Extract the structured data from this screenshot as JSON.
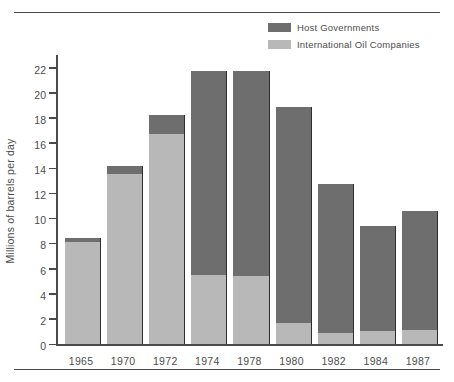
{
  "chart_data": {
    "type": "bar",
    "title": "",
    "subtitle": "",
    "xlabel": "",
    "ylabel": "Millions of barrels per day",
    "ylim": [
      0,
      23
    ],
    "yticks": [
      0,
      2,
      4,
      6,
      8,
      10,
      12,
      14,
      16,
      18,
      20,
      22
    ],
    "grid": false,
    "stacked": true,
    "legend_position": "top-right",
    "categories": [
      "1965",
      "1970",
      "1972",
      "1974",
      "1978",
      "1980",
      "1982",
      "1984",
      "1987"
    ],
    "series": [
      {
        "name": "International Oil Companies",
        "color": "#b8b8b8",
        "values": [
          8.1,
          13.5,
          16.7,
          5.5,
          5.4,
          1.7,
          0.9,
          1.0,
          1.1
        ]
      },
      {
        "name": "Host Governments",
        "color": "#6e6e6e",
        "values": [
          0.3,
          0.7,
          1.5,
          16.2,
          16.3,
          17.2,
          11.8,
          8.4,
          9.5
        ]
      }
    ],
    "totals": [
      8.4,
      14.2,
      18.2,
      21.7,
      21.7,
      18.9,
      12.7,
      9.4,
      10.6
    ]
  },
  "legend": {
    "items": [
      {
        "label": "Host Governments",
        "swatch": "#6e6e6e"
      },
      {
        "label": "International Oil Companies",
        "swatch": "#b8b8b8"
      }
    ]
  },
  "axes": {
    "y_label": "Millions of barrels per day",
    "y_ticks": [
      "22",
      "20",
      "18",
      "16",
      "14",
      "12",
      "10",
      "8",
      "6",
      "4",
      "2",
      "0"
    ],
    "x_ticks": [
      "1965",
      "1970",
      "1972",
      "1974",
      "1978",
      "1980",
      "1982",
      "1984",
      "1987"
    ]
  },
  "colors": {
    "host_governments": "#6e6e6e",
    "international_oil_companies": "#b8b8b8",
    "axis": "#4a4a4a",
    "text": "#4d4d4d",
    "background": "#ffffff"
  }
}
